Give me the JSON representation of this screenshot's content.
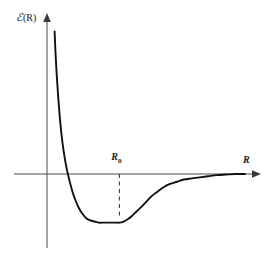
{
  "figure": {
    "title": "",
    "background_color": "#ffffff",
    "line_color": "#111111",
    "axis_color": "#4a4a4a",
    "text_color": "#1a1a1a"
  },
  "labels": {
    "y_axis": "ℰ(R)",
    "y_axis_symbol": "ℰ",
    "y_axis_arg": "(R)",
    "x_axis": "R",
    "equilibrium": "R",
    "equilibrium_subscript": "0",
    "equilibrium_full": "R₀"
  },
  "chart_data": {
    "type": "line",
    "title": "",
    "xlabel": "R",
    "ylabel": "ℰ(R)",
    "grid": false,
    "legend": null,
    "xlim": [
      0,
      1
    ],
    "ylim": [
      -0.35,
      1.0
    ],
    "annotations": [
      {
        "text": "R₀",
        "kind": "equilibrium-bond-length",
        "x": 0.3655,
        "y": 0.0,
        "dashed_guide": true,
        "guide_from_y": 0.0,
        "guide_to_y": -0.2095
      }
    ],
    "axes": {
      "x_axis_crosses_y_at": 0.0,
      "y_axis_crosses_x_at": 0.0,
      "x_arrow": true,
      "y_arrow": true
    },
    "series": [
      {
        "name": "potential-energy-curve",
        "description": "Morse-like intermolecular potential energy",
        "x": [
          0.0384,
          0.0432,
          0.049,
          0.0558,
          0.0635,
          0.0731,
          0.0846,
          0.0981,
          0.1134,
          0.1288,
          0.1442,
          0.1615,
          0.1788,
          0.1981,
          0.2192,
          0.2404,
          0.2615,
          0.2827,
          0.3038,
          0.325,
          0.3462,
          0.3655,
          0.3865,
          0.4077,
          0.4288,
          0.4519,
          0.475,
          0.5019,
          0.5288,
          0.5577,
          0.5885,
          0.6212,
          0.6558,
          0.6923,
          0.7308,
          0.7712,
          0.8135,
          0.8577,
          0.9038,
          0.9519,
          1.0
        ],
        "y": [
          0.6143,
          0.519,
          0.4286,
          0.3429,
          0.2571,
          0.1714,
          0.0952,
          0.0286,
          -0.0286,
          -0.0762,
          -0.1143,
          -0.1476,
          -0.1714,
          -0.1905,
          -0.2,
          -0.2048,
          -0.2095,
          -0.2095,
          -0.2095,
          -0.2095,
          -0.2095,
          -0.2095,
          -0.2048,
          -0.1952,
          -0.181,
          -0.1619,
          -0.1429,
          -0.119,
          -0.0952,
          -0.0762,
          -0.0571,
          -0.0429,
          -0.0333,
          -0.0238,
          -0.019,
          -0.0143,
          -0.0095,
          -0.0048,
          -0.0024,
          0.0,
          0.0
        ],
        "minimum": {
          "x": 0.3655,
          "y": -0.2095
        },
        "zero_crossing": {
          "x": 0.1176,
          "y": 0.0
        },
        "asymptote": 0.0
      }
    ]
  }
}
